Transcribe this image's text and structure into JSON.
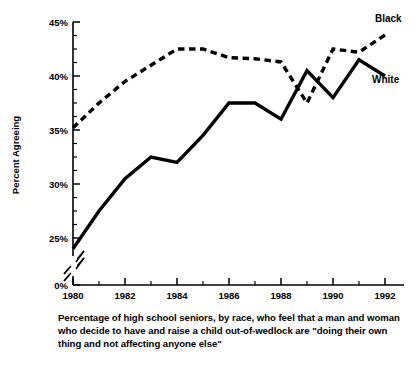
{
  "figure": {
    "caption": "Percentage of high school seniors, by race, who feel that a man and woman who decide to have and raise a child out-of-wedlock are \"doing their own thing and not affecting anyone else\""
  },
  "chart_data": {
    "type": "line",
    "title": "",
    "xlabel": "",
    "ylabel": "Percent Agreeing",
    "x": [
      1980,
      1981,
      1982,
      1983,
      1984,
      1985,
      1986,
      1987,
      1988,
      1989,
      1990,
      1991,
      1992
    ],
    "xlim": [
      1980,
      1992
    ],
    "ylim": [
      0,
      45
    ],
    "y_axis_break": true,
    "y_axis_break_from": 0,
    "y_axis_break_to": 23,
    "grid": false,
    "legend_position": "inline-right",
    "xtick_labels": [
      "1980",
      "1982",
      "1984",
      "1986",
      "1988",
      "1990",
      "1992"
    ],
    "xtick_values": [
      1980,
      1982,
      1984,
      1986,
      1988,
      1990,
      1992
    ],
    "xminor_tick_values": [
      1981,
      1983,
      1985,
      1987,
      1989,
      1991
    ],
    "ytick_labels": [
      "0%",
      "25%",
      "30%",
      "35%",
      "40%",
      "45%"
    ],
    "ytick_values": [
      0,
      25,
      30,
      35,
      40,
      45
    ],
    "yminor_tick_values": [
      26.25,
      27.5,
      28.75,
      31.25,
      32.5,
      33.75,
      36.25,
      37.5,
      38.75,
      41.25,
      42.5,
      43.75
    ],
    "series": [
      {
        "name": "Black",
        "style": "dashed",
        "color": "#000000",
        "label_text": "Black",
        "values": [
          35.2,
          37.5,
          39.5,
          41.0,
          42.5,
          42.5,
          41.7,
          41.6,
          41.3,
          37.5,
          42.5,
          42.2,
          43.8
        ]
      },
      {
        "name": "White",
        "style": "solid",
        "color": "#000000",
        "label_text": "White",
        "values": [
          24.0,
          27.5,
          30.5,
          32.5,
          32.0,
          34.5,
          37.5,
          37.5,
          36.0,
          40.5,
          38.0,
          41.5,
          40.0
        ]
      }
    ]
  }
}
